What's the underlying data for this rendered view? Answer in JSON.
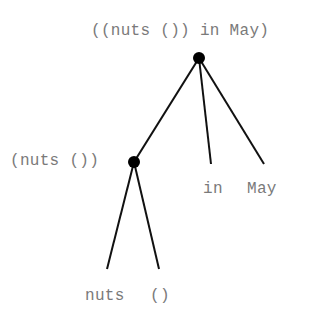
{
  "diagram": {
    "type": "parse-tree",
    "edge_color": "#111111",
    "node_color": "#000000",
    "label_color": "#7a7a7a",
    "nodes": {
      "root": {
        "label": "((nuts ()) in May)",
        "x": 199,
        "y": 58
      },
      "inner": {
        "label": "(nuts ())",
        "x": 134,
        "y": 162
      }
    },
    "leaves": {
      "in": {
        "label": "in"
      },
      "may": {
        "label": "May"
      },
      "nuts": {
        "label": "nuts"
      },
      "empty": {
        "label": "()"
      }
    }
  }
}
